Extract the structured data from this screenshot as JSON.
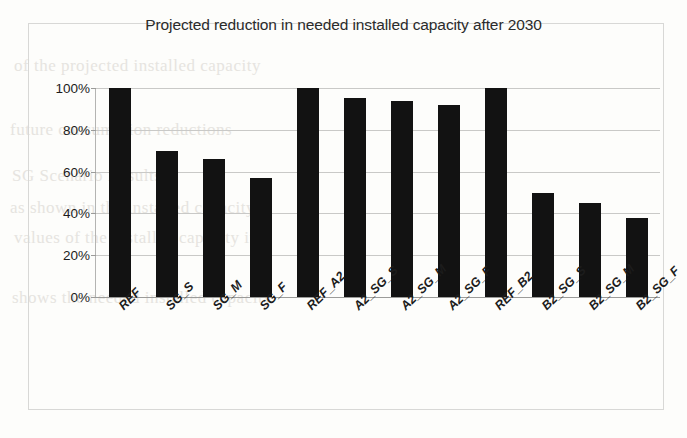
{
  "figure": {
    "title": "Projected reduction in needed installed capacity after 2030"
  },
  "chart_data": {
    "type": "bar",
    "title": "Projected reduction in needed installed capacity after 2030",
    "xlabel": "",
    "ylabel": "",
    "ylim": [
      0,
      100
    ],
    "yunit": "%",
    "grid": true,
    "legend": "none",
    "bar_color": "#121212",
    "categories": [
      "REF",
      "SG_S",
      "SG_M",
      "SG_F",
      "REF_A2",
      "A2_SG_S",
      "A2_SG_M",
      "A2_SG_F",
      "REF_B2",
      "B2_SG_S",
      "B2_SG_M",
      "B2_SG_F"
    ],
    "values": [
      100,
      70,
      66,
      57,
      100,
      95,
      94,
      92,
      100,
      50,
      45,
      38
    ],
    "ytick_labels": [
      "0%",
      "20%",
      "40%",
      "60%",
      "80%",
      "100%"
    ],
    "ytick_values": [
      0,
      20,
      40,
      60,
      80,
      100
    ]
  },
  "background_text": {
    "lines": [
      "of the projected  installed  capacity",
      "future consumption  reductions",
      "SG Scenario  Results",
      "as shown  in the  installed  capacity",
      "values  of the installed  capacity  in",
      "shows  the needed  installed  capacity"
    ]
  }
}
